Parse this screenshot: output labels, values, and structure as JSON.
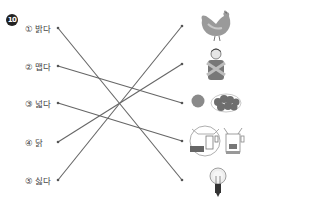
{
  "question_number": "10",
  "items": [
    {
      "label": "① 밝다"
    },
    {
      "label": "② 맵다"
    },
    {
      "label": "③ 넓다"
    },
    {
      "label": "④ 닭"
    },
    {
      "label": "⑤ 싫다"
    }
  ],
  "pictures": [
    {
      "icon": "chicken-icon"
    },
    {
      "icon": "person-crossed-arms-icon"
    },
    {
      "icon": "tomato-peppers-icon"
    },
    {
      "icon": "room-icon"
    },
    {
      "icon": "light-bulb-icon"
    }
  ],
  "connections": [
    {
      "from": 1,
      "to": 5
    },
    {
      "from": 2,
      "to": 3
    },
    {
      "from": 3,
      "to": 4
    },
    {
      "from": 4,
      "to": 2
    },
    {
      "from": 5,
      "to": 1
    }
  ],
  "colors": {
    "line": "#666666"
  }
}
